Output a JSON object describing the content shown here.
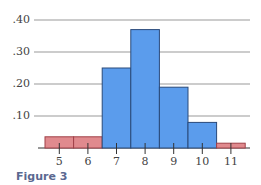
{
  "chart_data": {
    "type": "bar",
    "title": "",
    "xlabel": "",
    "ylabel": "",
    "categories": [
      "5",
      "6",
      "7",
      "8",
      "9",
      "10",
      "11"
    ],
    "values": [
      0.035,
      0.035,
      0.25,
      0.37,
      0.19,
      0.08,
      0.015
    ],
    "bar_colors": [
      "#e08a8e",
      "#e08a8e",
      "#5b9cec",
      "#5b9cec",
      "#5b9cec",
      "#5b9cec",
      "#e08a8e"
    ],
    "ylim": [
      0,
      0.42
    ],
    "yticks": [
      0.1,
      0.2,
      0.3,
      0.4
    ],
    "ytick_labels": [
      ".10",
      ".20",
      ".30",
      ".40"
    ],
    "grid": true,
    "legend": null,
    "histogram": true
  },
  "caption": "Figure 3",
  "colors": {
    "highlight_bar": "#5b9cec",
    "tail_bar": "#e08a8e",
    "bar_stroke": "#2a4a7a",
    "gridline": "#9a9a9a",
    "caption": "#5a6890"
  }
}
